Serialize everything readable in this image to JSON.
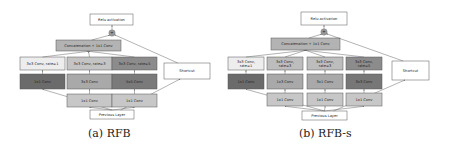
{
  "figures": [
    {
      "id": "rfb",
      "caption": "(a) RFB",
      "relu_label": "Relu activation",
      "concat_label": "Concatenation + 1x1 Conv",
      "add_symbol": "+",
      "shortcut_label": "Shortcut",
      "previous_label": "Previous Layer",
      "branches": [
        {
          "top": [
            "3x3 Conv, rate=1"
          ],
          "mid": "1x1 Conv",
          "bottom": null,
          "top_color": "#ededed",
          "mid_color": "#6b6b6b"
        },
        {
          "top": [
            "3x3 Conv, rate=3"
          ],
          "mid": "3x3 Conv",
          "bottom": "1x1 Conv",
          "top_color": "#c4c4c4",
          "mid_color": "#a9a9a9"
        },
        {
          "top": [
            "3x3 Conv, rate=5"
          ],
          "mid": "5x5 Conv",
          "bottom": "1x1 Conv",
          "top_color": "#8c8c8c",
          "mid_color": "#7a7a7a"
        }
      ]
    },
    {
      "id": "rfb-s",
      "caption": "(b) RFB-s",
      "relu_label": "Relu activation",
      "concat_label": "Concatenation + 1x1 Conv",
      "add_symbol": "+",
      "shortcut_label": "Shortcut",
      "previous_label": "Previous Layer",
      "branches": [
        {
          "top": [
            "3x3 Conv,",
            "rate=1"
          ],
          "mid": "1x1 Conv",
          "bottom": null,
          "top_color": "#ededed",
          "mid_color": "#6b6b6b"
        },
        {
          "top": [
            "3x3 Conv,",
            "rate=3"
          ],
          "mid": "1x3 Conv",
          "bottom": "1x1 Conv",
          "top_color": "#bdbdbd",
          "mid_color": "#a9a9a9"
        },
        {
          "top": [
            "3x3 Conv,",
            "rate=3"
          ],
          "mid": "3x1 Conv",
          "bottom": "1x1 Conv",
          "top_color": "#bdbdbd",
          "mid_color": "#a9a9a9"
        },
        {
          "top": [
            "3x3 Conv,",
            "rate=5"
          ],
          "mid": "3x3 Conv",
          "bottom": "1x1 Conv",
          "top_color": "#8c8c8c",
          "mid_color": "#777777"
        }
      ]
    }
  ],
  "colors": {
    "concat_fill": "#b3b3b3",
    "bottom_fill": "#c7c7c7",
    "white_fill": "#ffffff",
    "stroke": "#555555",
    "arrow": "#666666",
    "add_fill": "#999999"
  }
}
